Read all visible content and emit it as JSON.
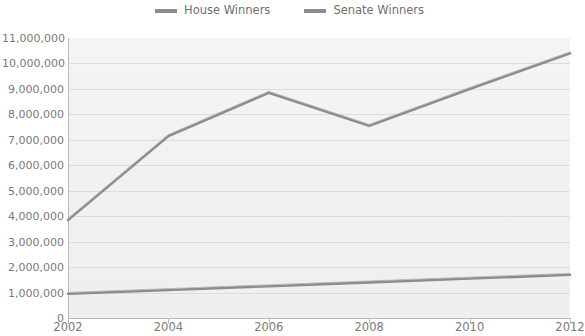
{
  "legend": {
    "position": "top-center",
    "items": [
      {
        "label": "House Winners",
        "color": "#8c8c8c",
        "swatch_name": "house-winners-swatch"
      },
      {
        "label": "Senate Winners",
        "color": "#8c8c8c",
        "swatch_name": "senate-winners-swatch"
      }
    ]
  },
  "axes": {
    "y_ticks": [
      "0",
      "1,000,000",
      "2,000,000",
      "3,000,000",
      "4,000,000",
      "5,000,000",
      "6,000,000",
      "7,000,000",
      "8,000,000",
      "9,000,000",
      "10,000,000",
      "11,000,000"
    ],
    "x_ticks": [
      "2002",
      "2004",
      "2006",
      "2008",
      "2010",
      "2012"
    ]
  },
  "chart_data": {
    "type": "line",
    "title": "",
    "subtitle": "",
    "xlabel": "",
    "ylabel": "",
    "x": [
      2002,
      2004,
      2006,
      2008,
      2010,
      2012
    ],
    "categories": [
      "2002",
      "2004",
      "2006",
      "2008",
      "2010",
      "2012"
    ],
    "series": [
      {
        "name": "House Winners",
        "color": "#8c8c8c",
        "values": [
          3850000,
          7150000,
          8850000,
          7550000,
          9000000,
          10400000
        ]
      },
      {
        "name": "Senate Winners",
        "color": "#8c8c8c",
        "values": [
          950000,
          1100000,
          1250000,
          1400000,
          1550000,
          1700000
        ]
      }
    ],
    "ylim": [
      0,
      11000000
    ],
    "ytick_step": 1000000,
    "xlim": [
      2002,
      2012
    ],
    "grid": true,
    "grid_axis": "y",
    "legend_position": "top-center",
    "plot_background": "#f1f1f1",
    "grid_color": "#dcdcdc",
    "axis_color": "#b9b9b9",
    "tick_label_color": "#7a7a7a"
  }
}
